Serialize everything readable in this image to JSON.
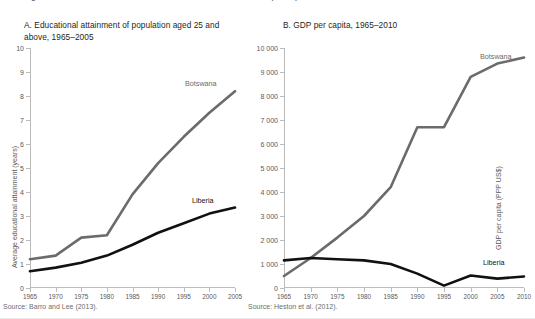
{
  "figure": {
    "clipped_header": "Figure 1. Botswana and Liberia: educational attainment and GDP per capita",
    "footer_rule": true
  },
  "panel_a": {
    "title": "A. Educational attainment of population aged 25 and above, 1965–2005",
    "source": "Source: Barro and Lee (2013).",
    "label_botswana": "Botswana",
    "label_liberia": "Liberia"
  },
  "panel_b": {
    "title": "B. GDP per capita, 1965–2010",
    "source": "Source: Heston et al. (2012).",
    "label_botswana": "Botswana",
    "label_liberia": "Liberia"
  },
  "colors": {
    "botswana": "#6b6b6b",
    "liberia": "#111111",
    "axis": "#bcbcbc",
    "tick_text": "#58595b",
    "title_text": "#231f20",
    "source_text": "#6d6e71"
  },
  "chart_data": [
    {
      "type": "line",
      "panel": "A",
      "title": "A. Educational attainment of population aged 25 and above, 1965–2005",
      "xlabel": "",
      "ylabel": "Average educational attainment (years)",
      "x": [
        1965,
        1970,
        1975,
        1980,
        1985,
        1990,
        1995,
        2000,
        2005
      ],
      "xlim": [
        1965,
        2005
      ],
      "ylim": [
        0,
        10
      ],
      "yticks": [
        0,
        1,
        2,
        3,
        4,
        5,
        6,
        7,
        8,
        9,
        10
      ],
      "ytick_labels": [
        "0",
        "1",
        "2",
        "3",
        "4",
        "5",
        "6",
        "7",
        "8",
        "9",
        "10"
      ],
      "xticks": [
        1965,
        1970,
        1975,
        1980,
        1985,
        1990,
        1995,
        2000,
        2005
      ],
      "xtick_labels": [
        "1965",
        "1970",
        "1975",
        "1980",
        "1985",
        "1990",
        "1995",
        "2000",
        "2005"
      ],
      "grid": false,
      "legend": "inline-labels",
      "series": [
        {
          "name": "Botswana",
          "color": "#6b6b6b",
          "values": [
            1.2,
            1.35,
            2.1,
            2.2,
            3.9,
            5.2,
            6.3,
            7.3,
            8.2
          ]
        },
        {
          "name": "Liberia",
          "color": "#111111",
          "values": [
            0.7,
            0.85,
            1.05,
            1.35,
            1.8,
            2.3,
            2.7,
            3.1,
            3.35
          ]
        }
      ],
      "source": "Source: Barro and Lee (2013)."
    },
    {
      "type": "line",
      "panel": "B",
      "title": "B. GDP per capita, 1965–2010",
      "xlabel": "",
      "ylabel": "GDP per capita (PPP US$)",
      "x": [
        1965,
        1970,
        1975,
        1980,
        1985,
        1990,
        1995,
        2000,
        2005,
        2010
      ],
      "xlim": [
        1965,
        2010
      ],
      "ylim": [
        0,
        10000
      ],
      "yticks": [
        0,
        1000,
        2000,
        3000,
        4000,
        5000,
        6000,
        7000,
        8000,
        9000,
        10000
      ],
      "ytick_labels": [
        "0",
        "1 000",
        "2 000",
        "3 000",
        "4 000",
        "5 000",
        "6 000",
        "7 000",
        "8 000",
        "9 000",
        "10 000"
      ],
      "xticks": [
        1965,
        1970,
        1975,
        1980,
        1985,
        1990,
        1995,
        2000,
        2005,
        2010
      ],
      "xtick_labels": [
        "1965",
        "1970",
        "1975",
        "1980",
        "1985",
        "1990",
        "1995",
        "2000",
        "2005",
        "2010"
      ],
      "grid": false,
      "legend": "inline-labels",
      "series": [
        {
          "name": "Botswana",
          "color": "#6b6b6b",
          "values": [
            500,
            1250,
            2100,
            3000,
            4200,
            6700,
            6700,
            8800,
            9350,
            9600
          ]
        },
        {
          "name": "Liberia",
          "color": "#111111",
          "values": [
            1150,
            1250,
            1200,
            1150,
            1000,
            600,
            100,
            520,
            390,
            480
          ]
        }
      ],
      "source": "Source: Heston et al. (2012)."
    }
  ]
}
